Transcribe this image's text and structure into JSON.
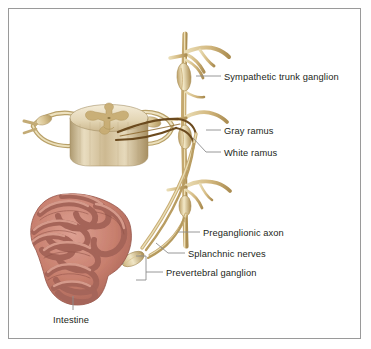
{
  "figure": {
    "background_color": "#ffffff",
    "border_color": "#9a9a9a",
    "text_color": "#231f20",
    "leader_color": "#8c8c8c"
  },
  "palette": {
    "nerve_tan": "#d8c38d",
    "nerve_tan_light": "#ece0bb",
    "nerve_tan_dark": "#b59b5c",
    "trunk_tan": "#ddc694",
    "preganglionic_brown": "#6b4a1e",
    "cord_cream": "#e8dcc0",
    "cord_shadow": "#b9a882",
    "intestine_pink": "#c97f72",
    "intestine_light": "#e3a99a",
    "intestine_dark": "#9e5b51",
    "fiber_gray": "#9b9b9b"
  },
  "labels": [
    {
      "id": "sympathetic-trunk-ganglion",
      "text": "Sympathetic trunk ganglion",
      "x": 224,
      "y": 72
    },
    {
      "id": "gray-ramus",
      "text": "Gray ramus",
      "x": 224,
      "y": 126
    },
    {
      "id": "white-ramus",
      "text": "White ramus",
      "x": 224,
      "y": 148
    },
    {
      "id": "preganglionic-axon",
      "text": "Preganglionic axon",
      "x": 203,
      "y": 228
    },
    {
      "id": "splanchnic-nerves",
      "text": "Splanchnic nerves",
      "x": 188,
      "y": 249
    },
    {
      "id": "prevertebral-ganglion",
      "text": "Prevertebral ganglion",
      "x": 166,
      "y": 268
    },
    {
      "id": "intestine",
      "text": "Intestine",
      "x": 53,
      "y": 315
    }
  ],
  "structures": [
    {
      "id": "spinal-cord",
      "name": "Spinal cord cross-section"
    },
    {
      "id": "sympathetic-trunk",
      "name": "Sympathetic trunk"
    },
    {
      "id": "trunk-ganglion-upper",
      "name": "Upper sympathetic trunk ganglion"
    },
    {
      "id": "trunk-ganglion-middle",
      "name": "Middle sympathetic trunk ganglion"
    },
    {
      "id": "trunk-ganglion-lower",
      "name": "Lower sympathetic trunk ganglion"
    },
    {
      "id": "prevertebral-ganglion-structure",
      "name": "Prevertebral ganglion"
    },
    {
      "id": "intestine-structure",
      "name": "Intestine"
    },
    {
      "id": "splanchnic-nerve-fibers",
      "name": "Splanchnic nerve fibers"
    },
    {
      "id": "postganglionic-fibers",
      "name": "Postganglionic fibers to intestine"
    }
  ]
}
